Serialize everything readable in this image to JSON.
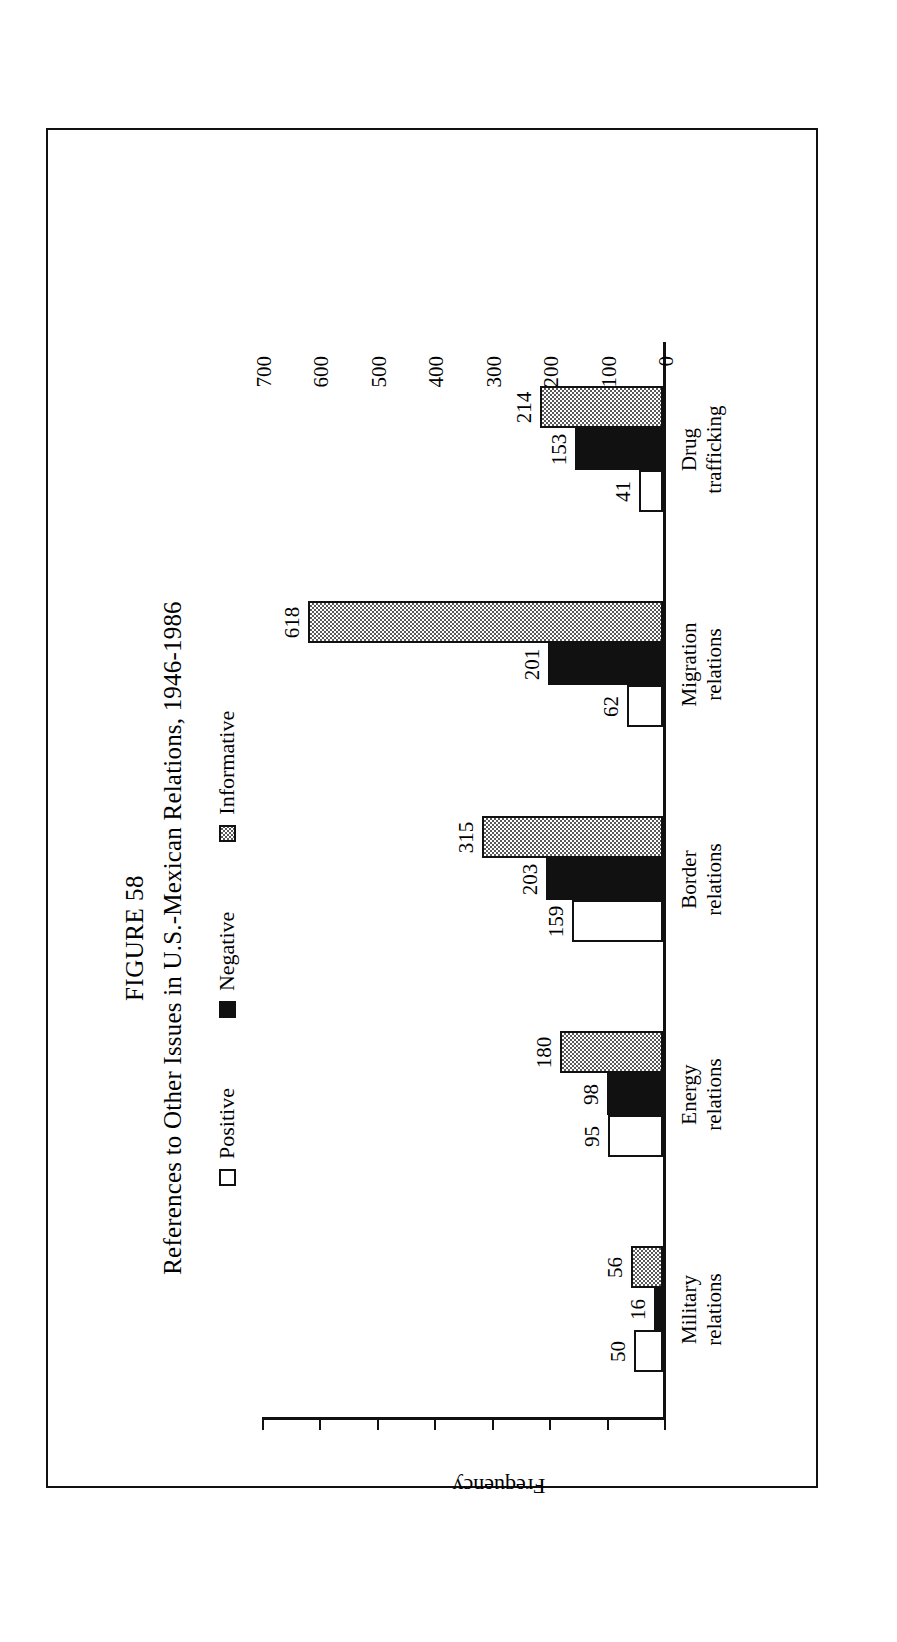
{
  "figure": {
    "number_label": "FIGURE 58",
    "caption": "References to Other Issues in U.S.-Mexican Relations, 1946-1986"
  },
  "chart_data": {
    "type": "bar",
    "orientation": "vertical",
    "title": "References to Other Issues in U.S.-Mexican Relations, 1946-1986",
    "subtitle": "FIGURE 58",
    "xlabel": "",
    "ylabel": "Frequency",
    "ylim": [
      0,
      700
    ],
    "ytick_step": 100,
    "yticks": [
      700,
      600,
      500,
      400,
      300,
      200,
      100,
      0
    ],
    "ytick_labels": [
      "700",
      "600",
      "500",
      "400",
      "300",
      "200",
      "100",
      "0"
    ],
    "grid": false,
    "legend_position": "top-center",
    "categories": [
      "Military\nrelations",
      "Energy\nrelations",
      "Border\nrelations",
      "Migration\nrelations",
      "Drug\ntrafficking"
    ],
    "series": [
      {
        "name": "Positive",
        "fill": "white",
        "color": "#ffffff",
        "values": [
          50,
          95,
          159,
          62,
          41
        ],
        "value_labels": [
          "50",
          "95",
          "159",
          "62",
          "41"
        ]
      },
      {
        "name": "Negative",
        "fill": "solid-black",
        "color": "#111111",
        "values": [
          16,
          98,
          203,
          201,
          153
        ],
        "value_labels": [
          "16",
          "98",
          "203",
          "201",
          "153"
        ]
      },
      {
        "name": "Informative",
        "fill": "hatched-gray",
        "color": "#9a9a9a",
        "values": [
          56,
          180,
          315,
          618,
          214
        ],
        "value_labels": [
          "56",
          "180",
          "315",
          "618",
          "214"
        ]
      }
    ]
  },
  "legend": {
    "items": [
      {
        "label": "Positive",
        "swatch": "white-square-icon"
      },
      {
        "label": "Negative",
        "swatch": "black-square-icon"
      },
      {
        "label": "Informative",
        "swatch": "hatched-square-icon"
      }
    ]
  }
}
